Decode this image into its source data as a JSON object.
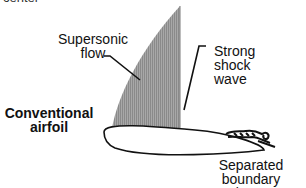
{
  "diagram": {
    "cut_off_text": "center",
    "labels": {
      "supersonic_line1": "Supersonic",
      "supersonic_line2": "flow",
      "shock_line1": "Strong",
      "shock_line2": "shock",
      "shock_line3": "wave",
      "airfoil_line1": "Conventional",
      "airfoil_line2": "airfoil",
      "separated_line1": "Separated boundary",
      "separated_line2": "layer"
    },
    "colors": {
      "supersonic_region": "#9a9a9a",
      "outline": "#111111",
      "background": "#ffffff"
    }
  }
}
